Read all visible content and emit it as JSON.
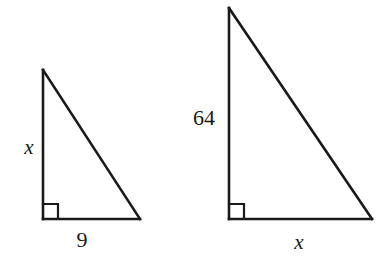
{
  "figure": {
    "background_color": "#ffffff",
    "stroke_color": "#1a1a1a",
    "stroke_width": 2.6
  },
  "triangles": [
    {
      "id": "left-triangle",
      "name": "small-right-triangle",
      "vertices": {
        "apex": {
          "x": 43,
          "y": 70
        },
        "right_angle": {
          "x": 43,
          "y": 219
        },
        "base_end": {
          "x": 140,
          "y": 219
        }
      },
      "right_angle_marker": {
        "size": 15,
        "shown": true
      },
      "labels": {
        "vertical_leg": "x",
        "vertical_leg_style": "italic",
        "horizontal_leg": "9",
        "horizontal_leg_style": "upright"
      }
    },
    {
      "id": "right-triangle",
      "name": "large-right-triangle",
      "vertices": {
        "apex": {
          "x": 229,
          "y": 8
        },
        "right_angle": {
          "x": 229,
          "y": 219
        },
        "base_end": {
          "x": 372,
          "y": 219
        }
      },
      "right_angle_marker": {
        "size": 15,
        "shown": true
      },
      "labels": {
        "vertical_leg": "64",
        "vertical_leg_style": "upright",
        "horizontal_leg": "x",
        "horizontal_leg_style": "italic"
      }
    }
  ],
  "labels": {
    "left_vertical": "x",
    "left_horizontal": "9",
    "right_vertical": "64",
    "right_horizontal": "x"
  }
}
